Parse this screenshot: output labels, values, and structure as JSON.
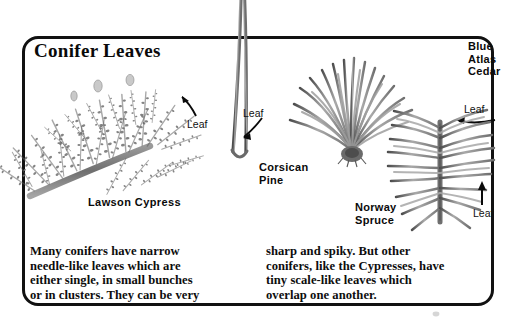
{
  "page": {
    "width": 520,
    "height": 322,
    "background": "#ffffff",
    "frame_color": "#111111"
  },
  "title": "Conifer Leaves",
  "specimens": [
    {
      "id": "lawson-cypress",
      "name": "Lawson Cypress",
      "callout": "Leaf",
      "foliage_type": "scale-like"
    },
    {
      "id": "corsican-pine",
      "name": "Corsican\nPine",
      "callout": "Leaf",
      "foliage_type": "paired-long-needles"
    },
    {
      "id": "blue-atlas-cedar",
      "name": "Blue\nAtlas\nCedar",
      "callout": "Leaf",
      "foliage_type": "needle-cluster"
    },
    {
      "id": "norway-spruce",
      "name": "Norway\nSpruce",
      "callout": "Leaf",
      "foliage_type": "single-needles-on-stem"
    }
  ],
  "body": {
    "left": "Many conifers have narrow\nneedle-like leaves which are\neither single, in small bunches\nor in clusters. They can be very",
    "right": "sharp and spiky. But other\nconifers, like the Cypresses, have\ntiny scale-like leaves which\noverlap one another."
  },
  "colors": {
    "ink": "#0a0a0a",
    "foliage_dark": "#5a5a5a",
    "foliage_mid": "#8c8c8c",
    "foliage_light": "#b8b8b8"
  }
}
